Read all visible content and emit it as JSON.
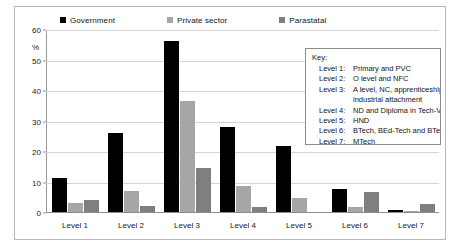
{
  "chart_data": {
    "type": "bar",
    "title": "",
    "xlabel": "",
    "ylabel": "%",
    "ylim": [
      0,
      60
    ],
    "yticks": [
      0,
      10,
      20,
      30,
      40,
      50,
      60
    ],
    "ytick_labels": [
      "0",
      "10",
      "20",
      "30",
      "40",
      "50",
      "60"
    ],
    "grid": true,
    "legend_position": "top",
    "categories": [
      "Level 1",
      "Level 2",
      "Level 3",
      "Level 4",
      "Level 5",
      "Level 6",
      "Level 7"
    ],
    "series": [
      {
        "name": "Government",
        "color": "#000000",
        "values": [
          11,
          26,
          56,
          28,
          21.5,
          7.5,
          0.5
        ]
      },
      {
        "name": "Private sector",
        "color": "#a6a6a6",
        "values": [
          3,
          7,
          36.5,
          8.5,
          4.5,
          1.5,
          0.3
        ]
      },
      {
        "name": "Parastatal",
        "color": "#7f7f7f",
        "values": [
          4,
          2,
          14.5,
          1.5,
          0,
          6.5,
          2.5
        ]
      }
    ]
  },
  "legend": {
    "items": [
      {
        "label": "Government",
        "color": "#000000"
      },
      {
        "label": "Private sector",
        "color": "#a6a6a6"
      },
      {
        "label": "Parastatal",
        "color": "#7f7f7f"
      }
    ]
  },
  "key_box": {
    "title": "Key:",
    "rows": [
      {
        "level": "Level 1:",
        "desc": "Primary and PVC",
        "cont": ""
      },
      {
        "level": "Level 2:",
        "desc": "O level and NFC",
        "cont": ""
      },
      {
        "level": "Level 3:",
        "desc": "A level, NC, apprenticeship and",
        "cont": "industrial attachment"
      },
      {
        "level": "Level 4:",
        "desc": "ND and Diploma in Tech-Voc",
        "cont": ""
      },
      {
        "level": "Level 5:",
        "desc": "HND",
        "cont": ""
      },
      {
        "level": "Level 6:",
        "desc": "BTech, BEd-Tech and BTechTr",
        "cont": ""
      },
      {
        "level": "Level 7:",
        "desc": "MTech",
        "cont": ""
      }
    ]
  }
}
